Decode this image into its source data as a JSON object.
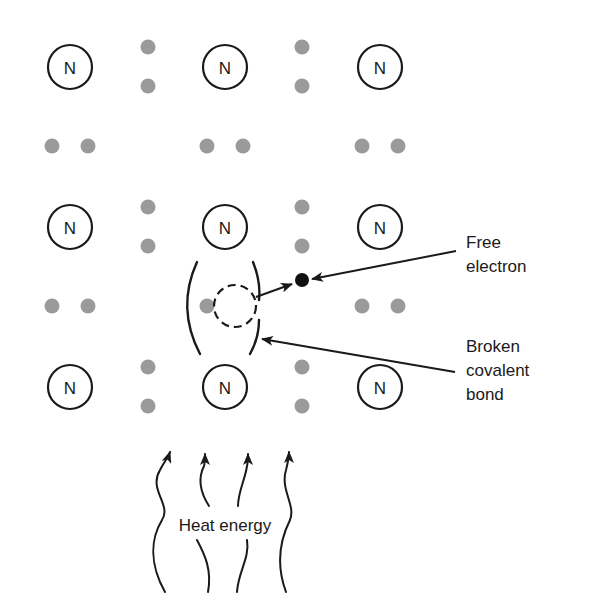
{
  "diagram": {
    "atom_symbol": "N",
    "atom_grid": {
      "rows": 3,
      "columns": 3
    },
    "callouts": {
      "free_electron": {
        "line1": "Free",
        "line2": "electron"
      },
      "broken_bond": {
        "line1": "Broken",
        "line2": "covalent",
        "line3": "bond"
      }
    },
    "heat_label": "Heat energy",
    "heat_arrow_count": 4,
    "colors": {
      "ink": "#1a1a1a",
      "valence_electron": "#9a9a9a",
      "free_electron": "#111111",
      "background": "#ffffff"
    }
  }
}
